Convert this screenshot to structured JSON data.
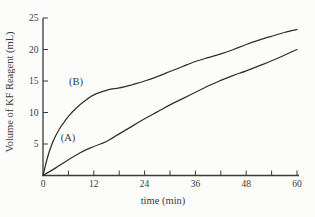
{
  "chart_data": {
    "type": "line",
    "title": "",
    "xlabel": "time (min)",
    "ylabel": "Volume of KF Reagent (mL)",
    "xlim": [
      0,
      60
    ],
    "ylim": [
      0,
      25
    ],
    "x_tick_step": 6,
    "x_major_ticks": [
      0,
      12,
      24,
      36,
      48,
      60
    ],
    "x_minor_ticks": [
      6,
      18,
      30,
      42,
      54
    ],
    "y_ticks": [
      5,
      10,
      15,
      20,
      25
    ],
    "origin_label": "0",
    "grid": false,
    "legend_position": "inline-labels",
    "line_color": "#2f2f2f",
    "axis_color": "#3a3a3a",
    "background_color": "#fcfcfa",
    "series": [
      {
        "name": "(A)",
        "label_pos": {
          "t": 5.9,
          "v": 6.0
        },
        "points": [
          [
            0,
            0
          ],
          [
            3,
            1.2
          ],
          [
            6,
            2.5
          ],
          [
            9,
            3.7
          ],
          [
            12,
            4.6
          ],
          [
            15,
            5.4
          ],
          [
            18,
            6.6
          ],
          [
            21,
            7.8
          ],
          [
            24,
            9.0
          ],
          [
            27,
            10.1
          ],
          [
            30,
            11.2
          ],
          [
            33,
            12.2
          ],
          [
            36,
            13.2
          ],
          [
            39,
            14.2
          ],
          [
            42,
            15.1
          ],
          [
            45,
            15.9
          ],
          [
            48,
            16.6
          ],
          [
            51,
            17.4
          ],
          [
            54,
            18.2
          ],
          [
            57,
            19.1
          ],
          [
            60,
            20.0
          ]
        ]
      },
      {
        "name": "(B)",
        "label_pos": {
          "t": 7.8,
          "v": 15.0
        },
        "points": [
          [
            0,
            0
          ],
          [
            1,
            2.7
          ],
          [
            2,
            4.8
          ],
          [
            3,
            6.3
          ],
          [
            4,
            7.5
          ],
          [
            5,
            8.5
          ],
          [
            6,
            9.4
          ],
          [
            8,
            10.8
          ],
          [
            10,
            11.9
          ],
          [
            12,
            12.8
          ],
          [
            14,
            13.3
          ],
          [
            16,
            13.7
          ],
          [
            18,
            13.9
          ],
          [
            21,
            14.4
          ],
          [
            24,
            15.0
          ],
          [
            27,
            15.7
          ],
          [
            30,
            16.5
          ],
          [
            33,
            17.3
          ],
          [
            36,
            18.1
          ],
          [
            39,
            18.7
          ],
          [
            42,
            19.3
          ],
          [
            45,
            20.0
          ],
          [
            48,
            20.8
          ],
          [
            51,
            21.5
          ],
          [
            54,
            22.1
          ],
          [
            57,
            22.7
          ],
          [
            60,
            23.2
          ]
        ]
      }
    ]
  }
}
